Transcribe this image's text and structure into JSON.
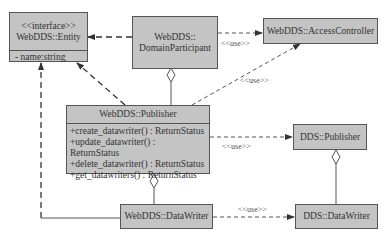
{
  "classes": {
    "entity": {
      "stereotype": "<<interface>>",
      "name": "WebDDS::Entity",
      "attributes": [
        "- name:string"
      ]
    },
    "domain_participant": {
      "name_line1": "WebDDS::",
      "name_line2": "DomainParticipant"
    },
    "access_controller": {
      "name": "WebDDS::AccessController"
    },
    "publisher": {
      "name": "WebDDS::Publisher",
      "methods": [
        "+create_datawriter() : ReturnStatus",
        "+update_datawriter() : ReturnStatus",
        "+delete_datawriter() : ReturnStatus",
        "+get_datawriters() : ReturnStatus"
      ]
    },
    "dds_publisher": {
      "name": "DDS::Publisher"
    },
    "webdds_datawriter": {
      "name": "WebDDS::DataWriter"
    },
    "dds_datawriter": {
      "name": "DDS::DataWriter"
    }
  },
  "relations": {
    "dp_to_access_controller": "<<use>>",
    "publisher_to_access_controller": "<<use>>",
    "publisher_to_dds_publisher": "<<use>>",
    "datawriter_to_dds_datawriter": "<<use>>"
  },
  "colors": {
    "box_fill": "#c4c4c4",
    "line": "#555555",
    "background": "#ffffff"
  }
}
